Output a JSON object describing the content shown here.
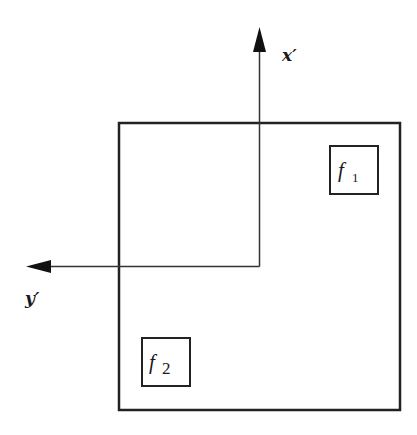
{
  "diagram": {
    "axes": {
      "vertical": {
        "label": "x",
        "prime": "′"
      },
      "horizontal": {
        "label": "y",
        "prime": "′"
      }
    },
    "boxes": [
      {
        "id": "f1",
        "symbol": "f",
        "subscript": "1"
      },
      {
        "id": "f2",
        "symbol": "f",
        "subscript": "2"
      }
    ],
    "colors": {
      "stroke": "#222222",
      "background": "#ffffff"
    }
  }
}
